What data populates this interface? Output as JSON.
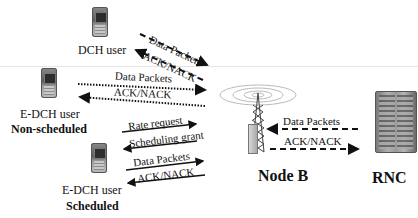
{
  "entities": {
    "dch_user": {
      "label": "DCH user"
    },
    "edch_nonscheduled": {
      "label": "E-DCH user",
      "sublabel": "Non-scheduled"
    },
    "edch_scheduled": {
      "label": "E-DCH user",
      "sublabel": "Scheduled"
    },
    "node_b": {
      "label": "Node B"
    },
    "rnc": {
      "label": "RNC"
    }
  },
  "links": {
    "dch": {
      "data": "Data Packets",
      "ack": "ACK/NACK",
      "style": "dashed"
    },
    "nonscheduled": {
      "data": "Data Packets",
      "ack": "ACK/NACK",
      "style": "dotted"
    },
    "scheduled": {
      "rate_request": "Rate request",
      "scheduling_grant": "Scheduling grant",
      "data": "Data Packets",
      "ack": "ACK/NACK",
      "style": "solid"
    },
    "iub": {
      "data": "Data Packets",
      "ack": "ACK/NACK",
      "style": "dashed"
    }
  },
  "colors": {
    "line": "#111111",
    "separator": "#e6e6e6",
    "background": "#ffffff"
  }
}
